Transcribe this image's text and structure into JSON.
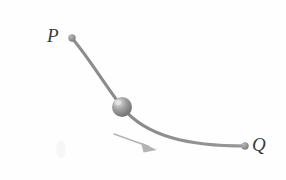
{
  "figure": {
    "background_color": "#fefefe",
    "width": 286,
    "height": 180
  },
  "labels": {
    "start_point": "P",
    "end_point": "Q"
  },
  "colors": {
    "wire": "#8a8a8a",
    "wire_shadow": "#9a9a9a",
    "endpoint_dot": "#8c8c8c",
    "bead_base": "#8f8f8f",
    "bead_highlight": "#d8d8d8",
    "bead_shadow": "#6e6e6e",
    "arrow": "#b4b4b4",
    "label_text": "#3c3c3c"
  },
  "geometry": {
    "start_point": {
      "x": 72,
      "y": 38
    },
    "end_point": {
      "x": 245,
      "y": 146
    },
    "bead_center": {
      "x": 122,
      "y": 107
    },
    "bead_radius": 10,
    "endpoint_dot_radius": 3.6,
    "wire_stroke_width": 3,
    "wire_path": "M 72 38 C 92 62 104 84 122 107 C 146 137 190 146 245 146",
    "arrow_start": {
      "x": 114,
      "y": 134
    },
    "arrow_end": {
      "x": 156,
      "y": 149
    },
    "arrow_path": "M 114 134 L 150 147",
    "arrow_head_points": "156,149 142,143 143,152"
  }
}
